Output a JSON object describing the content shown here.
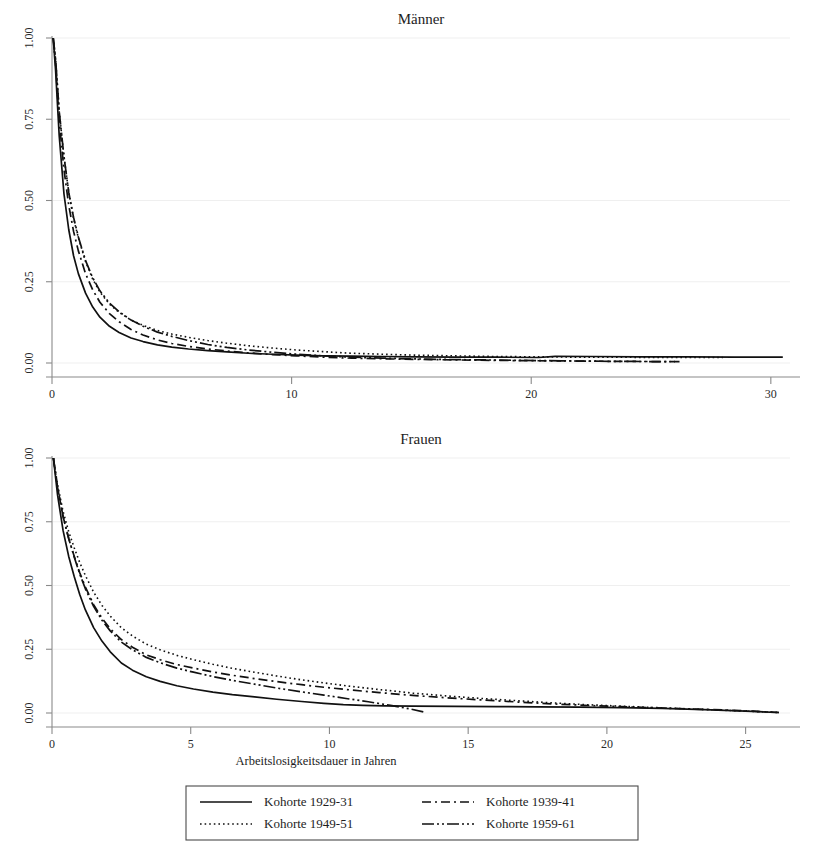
{
  "figure": {
    "background": "#ffffff",
    "ink_color": "#111111",
    "grid_color": "#efefef",
    "axis_color": "#8a8a8a",
    "x_axis_title": "Arbeitslosigkeitsdauer in Jahren"
  },
  "legend": {
    "entries": [
      {
        "label": "Kohorte 1929-31",
        "style": "solid",
        "dash": "none",
        "width": 1.7
      },
      {
        "label": "Kohorte 1939-41",
        "style": "dashed",
        "dash": "9,4,2,4",
        "width": 1.7
      },
      {
        "label": "Kohorte 1949-51",
        "style": "dotted",
        "dash": "1.6,3",
        "width": 1.6
      },
      {
        "label": "Kohorte 1959-61",
        "style": "dash-dot",
        "dash": "12,3,2,3,2,3",
        "width": 1.7
      }
    ]
  },
  "chart_data": [
    {
      "type": "line",
      "title": "Männer",
      "xlabel": "",
      "ylabel": "",
      "xlim": [
        0,
        30.8
      ],
      "ylim": [
        0,
        1.0
      ],
      "xticks": [
        0,
        10,
        20,
        30
      ],
      "xtick_labels": [
        "0",
        "10",
        "20",
        "30"
      ],
      "yticks": [
        0.0,
        0.25,
        0.5,
        0.75,
        1.0
      ],
      "ytick_labels": [
        "0.00",
        "0.25",
        "0.50",
        "0.75",
        "1.00"
      ],
      "grid": true,
      "legend_position": "below-figure",
      "series": [
        {
          "name": "Kohorte 1929-31",
          "style": "solid",
          "x": [
            0.05,
            0.15,
            0.3,
            0.5,
            0.7,
            0.9,
            1.1,
            1.4,
            1.7,
            2.0,
            2.4,
            2.8,
            3.3,
            3.8,
            4.4,
            5.0,
            5.7,
            6.5,
            7.3,
            8.2,
            9.2,
            10.2,
            11.3,
            12.5,
            13.8,
            15.2,
            16.8,
            18.5,
            20.3,
            21.0,
            22.5,
            24.5,
            26.5,
            28.5,
            30.5
          ],
          "y": [
            1.0,
            0.9,
            0.7,
            0.52,
            0.41,
            0.33,
            0.275,
            0.215,
            0.172,
            0.141,
            0.113,
            0.094,
            0.077,
            0.066,
            0.056,
            0.049,
            0.043,
            0.038,
            0.034,
            0.03,
            0.027,
            0.024,
            0.022,
            0.021,
            0.02,
            0.019,
            0.018,
            0.018,
            0.017,
            0.0205,
            0.02,
            0.019,
            0.019,
            0.018,
            0.018
          ]
        },
        {
          "name": "Kohorte 1939-41",
          "style": "dashed",
          "x": [
            0.05,
            0.15,
            0.3,
            0.5,
            0.7,
            0.9,
            1.1,
            1.4,
            1.7,
            2.0,
            2.4,
            2.8,
            3.3,
            3.8,
            4.4,
            5.0,
            5.7,
            6.5,
            7.3,
            8.2,
            9.2,
            10.2,
            11.3,
            12.5,
            13.8,
            15.2,
            16.8,
            18.5,
            20.3,
            22.0,
            23.5,
            25.0,
            26.2
          ],
          "y": [
            1.0,
            0.92,
            0.745,
            0.595,
            0.485,
            0.405,
            0.345,
            0.275,
            0.225,
            0.187,
            0.152,
            0.127,
            0.103,
            0.086,
            0.071,
            0.06,
            0.051,
            0.043,
            0.037,
            0.031,
            0.026,
            0.022,
            0.018,
            0.015,
            0.013,
            0.011,
            0.0095,
            0.008,
            0.007,
            0.006,
            0.005,
            0.0045,
            0.004
          ]
        },
        {
          "name": "Kohorte 1949-51",
          "style": "dotted",
          "x": [
            0.05,
            0.15,
            0.3,
            0.5,
            0.7,
            0.9,
            1.1,
            1.4,
            1.7,
            2.0,
            2.4,
            2.8,
            3.3,
            3.8,
            4.4,
            5.0,
            5.7,
            6.5,
            7.3,
            8.2,
            9.2,
            10.2,
            11.3,
            12.5,
            13.8,
            15.2,
            16.8,
            18.5,
            20.3,
            22.0,
            23.5,
            25.0,
            26.5,
            28.0
          ],
          "y": [
            1.0,
            0.935,
            0.775,
            0.635,
            0.525,
            0.445,
            0.385,
            0.312,
            0.258,
            0.218,
            0.181,
            0.156,
            0.132,
            0.116,
            0.1,
            0.089,
            0.079,
            0.069,
            0.061,
            0.053,
            0.046,
            0.04,
            0.035,
            0.03,
            0.027,
            0.024,
            0.022,
            0.02,
            0.019,
            0.018,
            0.018,
            0.017,
            0.017,
            0.017
          ]
        },
        {
          "name": "Kohorte 1959-61",
          "style": "dash-dot",
          "x": [
            0.05,
            0.15,
            0.3,
            0.5,
            0.7,
            0.9,
            1.1,
            1.4,
            1.7,
            2.0,
            2.4,
            2.8,
            3.3,
            3.8,
            4.4,
            5.0,
            5.7,
            6.5,
            7.3,
            8.2,
            9.2,
            10.2,
            11.3,
            12.5,
            13.8,
            15.2,
            16.8,
            18.5,
            20.3,
            22.0,
            23.5,
            25.0,
            26.0
          ],
          "y": [
            1.0,
            0.935,
            0.775,
            0.635,
            0.525,
            0.448,
            0.388,
            0.315,
            0.262,
            0.222,
            0.184,
            0.158,
            0.132,
            0.113,
            0.095,
            0.082,
            0.069,
            0.057,
            0.048,
            0.04,
            0.033,
            0.027,
            0.022,
            0.018,
            0.015,
            0.0125,
            0.0105,
            0.009,
            0.0075,
            0.006,
            0.005,
            0.0045,
            0.004
          ]
        }
      ]
    },
    {
      "type": "line",
      "title": "Frauen",
      "xlabel": "Arbeitslosigkeitsdauer in Jahren",
      "ylabel": "",
      "xlim": [
        0,
        26.6
      ],
      "ylim": [
        0,
        1.0
      ],
      "xticks": [
        0,
        5,
        10,
        15,
        20,
        25
      ],
      "xtick_labels": [
        "0",
        "5",
        "10",
        "15",
        "20",
        "25"
      ],
      "yticks": [
        0.0,
        0.25,
        0.5,
        0.75,
        1.0
      ],
      "ytick_labels": [
        "0.00",
        "0.25",
        "0.50",
        "0.75",
        "1.00"
      ],
      "grid": true,
      "legend_position": "below-figure",
      "series": [
        {
          "name": "Kohorte 1929-31",
          "style": "solid",
          "x": [
            0.05,
            0.2,
            0.4,
            0.6,
            0.8,
            1.0,
            1.2,
            1.5,
            1.8,
            2.1,
            2.5,
            2.9,
            3.4,
            3.9,
            4.5,
            5.1,
            5.8,
            6.5,
            7.3,
            8.1,
            9.0,
            9.8,
            10.5,
            11.2,
            12.0,
            13.0,
            14.5,
            16.0,
            17.5,
            19.0,
            20.5,
            22.0,
            23.5,
            25.0,
            26.2
          ],
          "y": [
            1.0,
            0.855,
            0.715,
            0.615,
            0.535,
            0.465,
            0.405,
            0.335,
            0.282,
            0.24,
            0.196,
            0.168,
            0.142,
            0.124,
            0.107,
            0.094,
            0.082,
            0.072,
            0.063,
            0.054,
            0.045,
            0.038,
            0.033,
            0.03,
            0.028,
            0.027,
            0.026,
            0.025,
            0.024,
            0.023,
            0.021,
            0.018,
            0.013,
            0.007,
            0.002
          ]
        },
        {
          "name": "Kohorte 1939-41",
          "style": "dashed",
          "x": [
            0.05,
            0.2,
            0.4,
            0.6,
            0.8,
            1.0,
            1.2,
            1.5,
            1.8,
            2.1,
            2.5,
            2.9,
            3.4,
            3.9,
            4.5,
            5.1,
            5.8,
            6.5,
            7.3,
            8.1,
            9.0,
            9.8,
            10.8,
            11.8,
            13.0,
            14.2,
            15.5,
            16.8,
            18.0,
            19.2,
            20.5,
            21.8,
            23.0,
            24.2,
            25.3,
            26.2
          ],
          "y": [
            1.0,
            0.885,
            0.77,
            0.685,
            0.615,
            0.55,
            0.495,
            0.425,
            0.372,
            0.33,
            0.288,
            0.258,
            0.228,
            0.209,
            0.19,
            0.176,
            0.161,
            0.148,
            0.135,
            0.123,
            0.111,
            0.101,
            0.09,
            0.08,
            0.069,
            0.06,
            0.051,
            0.043,
            0.036,
            0.03,
            0.025,
            0.02,
            0.016,
            0.012,
            0.007,
            0.002
          ]
        },
        {
          "name": "Kohorte 1949-51",
          "style": "dotted",
          "x": [
            0.05,
            0.2,
            0.4,
            0.6,
            0.8,
            1.0,
            1.2,
            1.5,
            1.8,
            2.1,
            2.5,
            2.9,
            3.4,
            3.9,
            4.5,
            5.1,
            5.8,
            6.5,
            7.3,
            8.1,
            9.0,
            9.8,
            10.8,
            11.8,
            13.0,
            14.2,
            15.5,
            16.8,
            18.0,
            19.2,
            20.5,
            21.8,
            23.0,
            24.2,
            25.3,
            26.2
          ],
          "y": [
            1.0,
            0.895,
            0.79,
            0.712,
            0.648,
            0.59,
            0.54,
            0.474,
            0.422,
            0.38,
            0.334,
            0.302,
            0.27,
            0.248,
            0.226,
            0.209,
            0.191,
            0.175,
            0.16,
            0.145,
            0.13,
            0.118,
            0.104,
            0.092,
            0.078,
            0.067,
            0.057,
            0.048,
            0.04,
            0.033,
            0.027,
            0.021,
            0.016,
            0.011,
            0.006,
            0.002
          ]
        },
        {
          "name": "Kohorte 1959-61",
          "style": "dash-dot",
          "x": [
            0.05,
            0.2,
            0.4,
            0.6,
            0.8,
            1.0,
            1.2,
            1.5,
            1.8,
            2.1,
            2.5,
            2.9,
            3.4,
            3.9,
            4.5,
            5.1,
            5.8,
            6.5,
            7.3,
            8.1,
            9.0,
            9.8,
            10.6,
            11.4,
            12.2,
            12.9,
            13.4
          ],
          "y": [
            1.0,
            0.885,
            0.77,
            0.685,
            0.612,
            0.545,
            0.488,
            0.418,
            0.364,
            0.322,
            0.278,
            0.248,
            0.218,
            0.197,
            0.176,
            0.16,
            0.143,
            0.128,
            0.113,
            0.098,
            0.083,
            0.07,
            0.057,
            0.044,
            0.03,
            0.016,
            0.004
          ]
        }
      ]
    }
  ]
}
